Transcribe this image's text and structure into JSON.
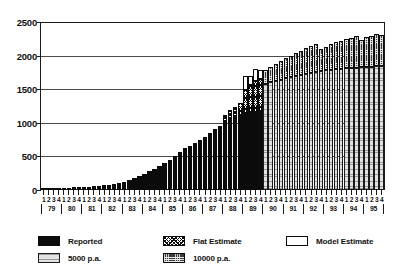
{
  "chart_data": {
    "type": "bar",
    "title": "",
    "subtitle": "",
    "xlabel": "",
    "ylabel": "",
    "ylim": [
      0,
      2500
    ],
    "yticks": [
      0,
      500,
      1000,
      1500,
      2000,
      2500
    ],
    "grid": true,
    "stacked": true,
    "legend_position": "below",
    "quarter_labels": [
      "1",
      "2",
      "3",
      "4"
    ],
    "years": [
      "79",
      "80",
      "81",
      "82",
      "83",
      "84",
      "85",
      "86",
      "87",
      "88",
      "89",
      "90",
      "91",
      "92",
      "93",
      "94",
      "95"
    ],
    "x": [
      "79 Q1",
      "79 Q2",
      "79 Q3",
      "79 Q4",
      "80 Q1",
      "80 Q2",
      "80 Q3",
      "80 Q4",
      "81 Q1",
      "81 Q2",
      "81 Q3",
      "81 Q4",
      "82 Q1",
      "82 Q2",
      "82 Q3",
      "82 Q4",
      "83 Q1",
      "83 Q2",
      "83 Q3",
      "83 Q4",
      "84 Q1",
      "84 Q2",
      "84 Q3",
      "84 Q4",
      "85 Q1",
      "85 Q2",
      "85 Q3",
      "85 Q4",
      "86 Q1",
      "86 Q2",
      "86 Q3",
      "86 Q4",
      "87 Q1",
      "87 Q2",
      "87 Q3",
      "87 Q4",
      "88 Q1",
      "88 Q2",
      "88 Q3",
      "88 Q4",
      "89 Q1",
      "89 Q2",
      "89 Q3",
      "89 Q4",
      "90 Q1",
      "90 Q2",
      "90 Q3",
      "90 Q4",
      "91 Q1",
      "91 Q2",
      "91 Q3",
      "91 Q4",
      "92 Q1",
      "92 Q2",
      "92 Q3",
      "92 Q4",
      "93 Q1",
      "93 Q2",
      "93 Q3",
      "93 Q4",
      "94 Q1",
      "94 Q2",
      "94 Q3",
      "94 Q4",
      "95 Q1",
      "95 Q2",
      "95 Q3",
      "95 Q4"
    ],
    "series": [
      {
        "name": "Reported",
        "key": "reported",
        "color": "#0b0b0b",
        "pattern": "solid-black",
        "values": [
          20,
          22,
          25,
          28,
          32,
          35,
          38,
          42,
          45,
          50,
          55,
          60,
          68,
          75,
          85,
          100,
          120,
          145,
          175,
          205,
          240,
          280,
          320,
          360,
          405,
          450,
          500,
          560,
          620,
          660,
          700,
          740,
          790,
          850,
          905,
          960,
          1010,
          1060,
          1090,
          1120,
          1150,
          1160,
          1165,
          1170,
          0,
          0,
          0,
          0,
          0,
          0,
          0,
          0,
          0,
          0,
          0,
          0,
          0,
          0,
          0,
          0,
          0,
          0,
          0,
          0,
          0,
          0,
          0,
          0
        ]
      },
      {
        "name": "Flat Estimate",
        "key": "flat_estimate",
        "color": "#0b0b0b",
        "pattern": "cross-hatch",
        "values": [
          0,
          0,
          0,
          0,
          0,
          0,
          0,
          0,
          0,
          0,
          0,
          0,
          0,
          0,
          0,
          0,
          0,
          0,
          0,
          0,
          0,
          0,
          0,
          0,
          0,
          0,
          0,
          0,
          0,
          0,
          0,
          0,
          0,
          0,
          0,
          0,
          110,
          130,
          150,
          180,
          340,
          400,
          450,
          480,
          0,
          0,
          0,
          0,
          0,
          0,
          0,
          0,
          0,
          0,
          0,
          0,
          0,
          0,
          0,
          0,
          0,
          0,
          0,
          0,
          0,
          0,
          0,
          0
        ]
      },
      {
        "name": "Model Estimate",
        "key": "model_estimate",
        "color": "#ffffff",
        "pattern": "open-white",
        "values": [
          0,
          0,
          0,
          0,
          0,
          0,
          0,
          0,
          0,
          0,
          0,
          0,
          0,
          0,
          0,
          0,
          0,
          0,
          0,
          0,
          0,
          0,
          0,
          0,
          0,
          0,
          0,
          0,
          0,
          0,
          0,
          0,
          0,
          0,
          0,
          0,
          0,
          0,
          0,
          0,
          200,
          140,
          180,
          130,
          0,
          0,
          0,
          0,
          0,
          0,
          0,
          0,
          0,
          0,
          0,
          0,
          0,
          0,
          0,
          0,
          0,
          0,
          0,
          0,
          0,
          0,
          0,
          0
        ]
      },
      {
        "name": "5000 p.a.",
        "key": "pa_5000",
        "color": "#e2e2e2",
        "pattern": "light-stipple",
        "values": [
          0,
          0,
          0,
          0,
          0,
          0,
          0,
          0,
          0,
          0,
          0,
          0,
          0,
          0,
          0,
          0,
          0,
          0,
          0,
          0,
          0,
          0,
          0,
          0,
          0,
          0,
          0,
          0,
          0,
          0,
          0,
          0,
          0,
          0,
          0,
          0,
          0,
          0,
          0,
          0,
          0,
          0,
          0,
          0,
          1580,
          1600,
          1620,
          1640,
          1660,
          1680,
          1700,
          1715,
          1730,
          1745,
          1760,
          1770,
          1780,
          1790,
          1800,
          1805,
          1810,
          1815,
          1820,
          1825,
          1830,
          1835,
          1840,
          1845
        ]
      },
      {
        "name": "10000 p.a.",
        "key": "pa_10000",
        "color": "#3a3a3a",
        "pattern": "dark-stipple",
        "values": [
          0,
          0,
          0,
          0,
          0,
          0,
          0,
          0,
          0,
          0,
          0,
          0,
          0,
          0,
          0,
          0,
          0,
          0,
          0,
          0,
          0,
          0,
          0,
          0,
          0,
          0,
          0,
          0,
          0,
          0,
          0,
          0,
          0,
          0,
          0,
          0,
          0,
          0,
          0,
          0,
          0,
          0,
          0,
          0,
          200,
          230,
          255,
          280,
          300,
          320,
          340,
          360,
          380,
          395,
          415,
          330,
          355,
          380,
          400,
          420,
          435,
          450,
          465,
          410,
          440,
          460,
          475,
          455
        ]
      }
    ]
  },
  "legend": {
    "items": [
      {
        "label": "Reported",
        "key": "reported"
      },
      {
        "label": "Flat Estimate",
        "key": "flat_estimate"
      },
      {
        "label": "Model Estimate",
        "key": "model_estimate"
      },
      {
        "label": "5000 p.a.",
        "key": "pa_5000"
      },
      {
        "label": "10000 p.a.",
        "key": "pa_10000"
      }
    ]
  }
}
